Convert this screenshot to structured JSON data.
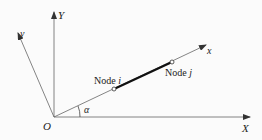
{
  "diagram": {
    "global_x_label": "X",
    "global_y_label": "Y",
    "local_x_label": "x",
    "local_y_label": "y",
    "origin_label": "O",
    "angle_label": "α",
    "node_i_prefix": "Node ",
    "node_i_var": "i",
    "node_j_prefix": "Node ",
    "node_j_var": "j",
    "colors": {
      "axis": "#555555",
      "element": "#111111",
      "background": "#fbfbfb"
    }
  }
}
